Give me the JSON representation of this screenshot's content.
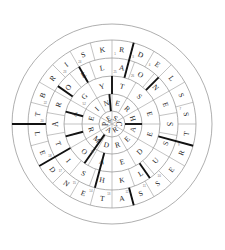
{
  "puzzle": {
    "title": "Circular Crossword Wheel",
    "type": "round-crossword",
    "center_x": 112,
    "center_y": 124,
    "radii": [
      13,
      30,
      48,
      66,
      84,
      100
    ],
    "ring_count": 5,
    "colors": {
      "grid": "#9a9a9a",
      "bar": "#111111",
      "letter": "#1c1c1c",
      "number": "#6e6e6e",
      "background": "#ffffff"
    },
    "rings": [
      {
        "name": "hub",
        "index": 0,
        "cell_count": 6,
        "inner_radius": 0,
        "outer_radius": 13,
        "start_angle": -90,
        "cells": [
          {
            "letter": "S",
            "number": ""
          },
          {
            "letter": "C",
            "number": ""
          },
          {
            "letter": "R",
            "number": ""
          },
          {
            "letter": "A",
            "number": ""
          },
          {
            "letter": "P",
            "number": ""
          },
          {
            "letter": "E",
            "number": "68"
          }
        ]
      },
      {
        "name": "ring-1",
        "index": 1,
        "cell_count": 12,
        "inner_radius": 13,
        "outer_radius": 30,
        "start_angle": -90,
        "cells": [
          {
            "letter": "E",
            "number": ""
          },
          {
            "letter": "R",
            "number": ""
          },
          {
            "letter": "H",
            "number": ""
          },
          {
            "letter": "A",
            "number": ""
          },
          {
            "letter": "E",
            "number": ""
          },
          {
            "letter": "R",
            "number": ""
          },
          {
            "letter": "D",
            "number": ""
          },
          {
            "letter": "M",
            "number": ""
          },
          {
            "letter": "R",
            "number": ""
          },
          {
            "letter": "E",
            "number": ""
          },
          {
            "letter": "I",
            "number": ""
          },
          {
            "letter": "N",
            "number": ""
          }
        ]
      },
      {
        "name": "ring-2",
        "index": 2,
        "cell_count": 12,
        "inner_radius": 30,
        "outer_radius": 48,
        "start_angle": -90,
        "cells": [
          {
            "letter": "T",
            "number": ""
          },
          {
            "letter": "S",
            "number": ""
          },
          {
            "letter": "E",
            "number": ""
          },
          {
            "letter": "E",
            "number": ""
          },
          {
            "letter": "D",
            "number": ""
          },
          {
            "letter": "E",
            "number": ""
          },
          {
            "letter": "A",
            "number": ""
          },
          {
            "letter": "O",
            "number": "54"
          },
          {
            "letter": "I",
            "number": ""
          },
          {
            "letter": "A",
            "number": ""
          },
          {
            "letter": "G",
            "number": "52"
          },
          {
            "letter": "Y",
            "number": ""
          }
        ]
      },
      {
        "name": "ring-3",
        "index": 3,
        "cell_count": 18,
        "inner_radius": 48,
        "outer_radius": 66,
        "start_angle": -90,
        "cells": [
          {
            "letter": "A",
            "number": "25"
          },
          {
            "letter": "O",
            "number": "26"
          },
          {
            "letter": "N",
            "number": ""
          },
          {
            "letter": "E",
            "number": ""
          },
          {
            "letter": "S",
            "number": ""
          },
          {
            "letter": "S",
            "number": ""
          },
          {
            "letter": "U",
            "number": ""
          },
          {
            "letter": "L",
            "number": ""
          },
          {
            "letter": "K",
            "number": ""
          },
          {
            "letter": "H",
            "number": ""
          },
          {
            "letter": "S",
            "number": ""
          },
          {
            "letter": "I",
            "number": ""
          },
          {
            "letter": "T",
            "number": ""
          },
          {
            "letter": "A",
            "number": ""
          },
          {
            "letter": "R",
            "number": ""
          },
          {
            "letter": "O",
            "number": ""
          },
          {
            "letter": "E",
            "number": ""
          },
          {
            "letter": "L",
            "number": ""
          }
        ]
      },
      {
        "name": "ring-4",
        "index": 4,
        "cell_count": 24,
        "inner_radius": 66,
        "outer_radius": 84,
        "start_angle": -90,
        "cells": [
          {
            "letter": "R",
            "number": "1"
          },
          {
            "letter": "D",
            "number": "3"
          },
          {
            "letter": "E",
            "number": "4"
          },
          {
            "letter": "L",
            "number": ""
          },
          {
            "letter": "S",
            "number": ""
          },
          {
            "letter": "S",
            "number": "7"
          },
          {
            "letter": "T",
            "number": ""
          },
          {
            "letter": "R",
            "number": "9"
          },
          {
            "letter": "E",
            "number": ""
          },
          {
            "letter": "S",
            "number": "10"
          },
          {
            "letter": "S",
            "number": "11"
          },
          {
            "letter": "A",
            "number": "12"
          },
          {
            "letter": "T",
            "number": "13"
          },
          {
            "letter": "E",
            "number": "14"
          },
          {
            "letter": "N",
            "number": "15"
          },
          {
            "letter": "D",
            "number": "17"
          },
          {
            "letter": "E",
            "number": "18"
          },
          {
            "letter": "L",
            "number": ""
          },
          {
            "letter": "T",
            "number": "20"
          },
          {
            "letter": "B",
            "number": "22"
          },
          {
            "letter": "R",
            "number": ""
          },
          {
            "letter": "I",
            "number": "23"
          },
          {
            "letter": "S",
            "number": "24"
          },
          {
            "letter": "K",
            "number": ""
          },
          {
            "letter": "E",
            "number": ""
          }
        ]
      }
    ],
    "bars": [
      {
        "angle": -75,
        "inner": 48,
        "outer": 84
      },
      {
        "angle": -90,
        "inner": 30,
        "outer": 48
      },
      {
        "angle": -45,
        "inner": 48,
        "outer": 66
      },
      {
        "angle": 15,
        "inner": 48,
        "outer": 84
      },
      {
        "angle": 0,
        "inner": 13,
        "outer": 30
      },
      {
        "angle": 55,
        "inner": 48,
        "outer": 66
      },
      {
        "angle": 75,
        "inner": 66,
        "outer": 84
      },
      {
        "angle": 105,
        "inner": 30,
        "outer": 66
      },
      {
        "angle": 125,
        "inner": 13,
        "outer": 48
      },
      {
        "angle": 150,
        "inner": 48,
        "outer": 84
      },
      {
        "angle": 165,
        "inner": 30,
        "outer": 48
      },
      {
        "angle": 180,
        "inner": 66,
        "outer": 100
      },
      {
        "angle": 195,
        "inner": 30,
        "outer": 48
      },
      {
        "angle": 215,
        "inner": 48,
        "outer": 66
      },
      {
        "angle": 240,
        "inner": 48,
        "outer": 66
      },
      {
        "angle": 265,
        "inner": 13,
        "outer": 30
      }
    ]
  }
}
